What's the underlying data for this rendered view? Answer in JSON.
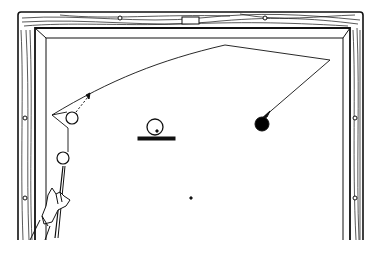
{
  "figure": {
    "colors": {
      "ink": "#111111",
      "background": "#ffffff",
      "ball_solid": "#000000"
    },
    "table": {
      "outer_frame": {
        "x": 18,
        "y": 12,
        "right": 363,
        "bottom": 240
      },
      "rail_inner": {
        "x": 35,
        "y": 28,
        "right": 350
      },
      "cushion_inner": {
        "x": 46,
        "y": 38,
        "right": 343
      },
      "top_diamonds": [
        {
          "x": 120,
          "y": 18
        },
        {
          "x": 265,
          "y": 18
        }
      ],
      "side_diamonds_left": [
        {
          "x": 25,
          "y": 118
        },
        {
          "x": 25,
          "y": 198
        }
      ],
      "side_diamonds_right": [
        {
          "x": 355,
          "y": 118
        },
        {
          "x": 355,
          "y": 198
        }
      ],
      "top_label_plate": {
        "x": 182,
        "y": 17,
        "w": 17,
        "h": 7
      }
    },
    "shot_path": {
      "points": [
        [
          52,
          115
        ],
        [
          225,
          45
        ],
        [
          330,
          60
        ],
        [
          262,
          118
        ]
      ],
      "arrow_end": "black-ball"
    },
    "balls": [
      {
        "name": "cue-ball-deflected",
        "x": 72,
        "y": 118,
        "r": 6,
        "fill": "none"
      },
      {
        "name": "cue-ball-start",
        "x": 63,
        "y": 158,
        "r": 6,
        "fill": "none"
      },
      {
        "name": "target-ball",
        "x": 262,
        "y": 124,
        "r": 7,
        "fill": "solid"
      },
      {
        "name": "spot-ball",
        "x": 155,
        "y": 128,
        "r": 7,
        "fill": "none"
      }
    ],
    "spot_bar": {
      "x1": 138,
      "x2": 175,
      "y": 138
    },
    "center_dot": {
      "x": 191,
      "y": 198
    },
    "hand": {
      "label": "Hand holding cue stick",
      "cue_tip": [
        63,
        166
      ]
    }
  }
}
